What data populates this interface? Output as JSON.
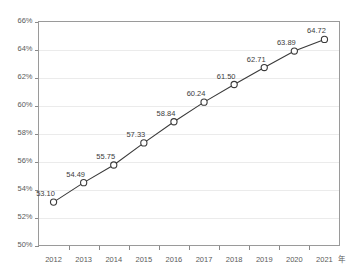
{
  "chart_data": {
    "type": "line",
    "title": "",
    "xlabel": "年",
    "ylabel": "",
    "categories": [
      "2012",
      "2013",
      "2014",
      "2015",
      "2016",
      "2017",
      "2018",
      "2019",
      "2020",
      "2021"
    ],
    "values": [
      53.1,
      54.49,
      55.75,
      57.33,
      58.84,
      60.24,
      61.5,
      62.71,
      63.89,
      64.72
    ],
    "point_labels": [
      "53.10",
      "54.49",
      "55.75",
      "57.33",
      "58.84",
      "60.24",
      "61.50",
      "62.71",
      "63.89",
      "64.72"
    ],
    "ylim": [
      50,
      66
    ],
    "ytick_values": [
      50,
      52,
      54,
      56,
      58,
      60,
      62,
      64,
      66
    ],
    "ytick_labels": [
      "50%",
      "52%",
      "54%",
      "56%",
      "58%",
      "60%",
      "62%",
      "64%",
      "66%"
    ],
    "grid": true,
    "legend": null,
    "marker": "open-circle",
    "series_color": "#3a3a3a",
    "grid_color": "#ebebeb",
    "background_color": "#ffffff"
  },
  "axes": {
    "x_unit_label": "年"
  }
}
